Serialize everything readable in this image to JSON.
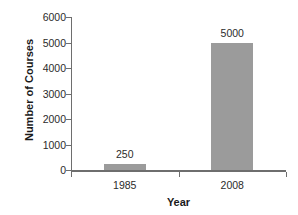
{
  "chart_data": {
    "type": "bar",
    "title": "",
    "subtitle": "",
    "xlabel": "Year",
    "ylabel": "Number of Courses",
    "categories": [
      "1985",
      "2008"
    ],
    "values": [
      250,
      5000
    ],
    "data_labels": [
      "250",
      "5000"
    ],
    "ylim": [
      0,
      6000
    ],
    "yticks": [
      0,
      1000,
      2000,
      3000,
      4000,
      5000,
      6000
    ],
    "ytick_labels": [
      "0",
      "1000",
      "2000",
      "3000",
      "4000",
      "5000",
      "6000"
    ],
    "grid": false,
    "legend": false,
    "legend_position": "none",
    "series": [
      {
        "name": "Number of Courses",
        "values": [
          250,
          5000
        ],
        "color": "#9b9b9b"
      }
    ],
    "colors": {
      "bar": "#9b9b9b",
      "axis": "#6e6e6e",
      "text": "#2b2b2b",
      "title_text": "#1a1a1a",
      "background": "#ffffff"
    }
  }
}
